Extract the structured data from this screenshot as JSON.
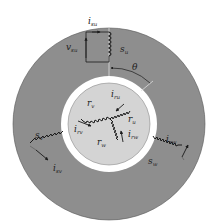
{
  "figure": {
    "type": "machine-cross-section",
    "colors": {
      "stator": "#8e8e8e",
      "air_gap": "#ffffff",
      "rotor": "#d4d4d4",
      "stroke": "#1a1a1a",
      "background": "#ffffff"
    },
    "angle_label": "θ",
    "stator_windings": [
      {
        "name": "s",
        "sub": "u",
        "current": {
          "base": "i",
          "sub": "su"
        },
        "voltage": {
          "base": "v",
          "sub": "su"
        }
      },
      {
        "name": "s",
        "sub": "v",
        "current": {
          "base": "i",
          "sub": "sv"
        }
      },
      {
        "name": "s",
        "sub": "w",
        "current": {
          "base": "i",
          "sub": "sw"
        }
      }
    ],
    "rotor_windings": [
      {
        "name": "r",
        "sub": "u",
        "current": {
          "base": "i",
          "sub": "ru"
        }
      },
      {
        "name": "r",
        "sub": "v",
        "current": {
          "base": "i",
          "sub": "rv"
        }
      },
      {
        "name": "r",
        "sub": "w",
        "current": {
          "base": "i",
          "sub": "rw"
        }
      }
    ]
  }
}
